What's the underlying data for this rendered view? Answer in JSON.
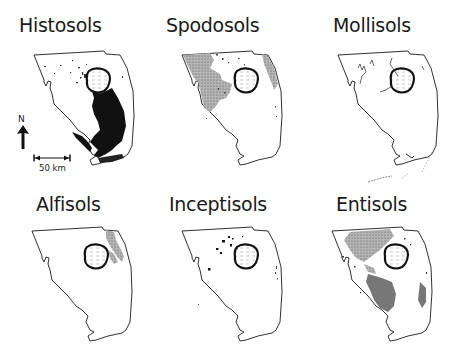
{
  "figure": {
    "panels": [
      {
        "id": "histosols",
        "title": "Histosols",
        "fill": "#111111",
        "pattern": "solid-black",
        "region": "Everglades south of Lake Okeechobee"
      },
      {
        "id": "spodosols",
        "title": "Spodosols",
        "fill": "#9a9a9a",
        "pattern": "stippled-gray",
        "region": "Northwest and east coast"
      },
      {
        "id": "mollisols",
        "title": "Mollisols",
        "fill": "#222222",
        "pattern": "thin-lines",
        "region": "Scattered river traces"
      },
      {
        "id": "alfisols",
        "title": "Alfisols",
        "fill": "#9a9a9a",
        "pattern": "stippled-gray",
        "region": "East coast north of lake"
      },
      {
        "id": "inceptisols",
        "title": "Inceptisols",
        "fill": "#111111",
        "pattern": "small-dots",
        "region": "Scattered near lake"
      },
      {
        "id": "entisols",
        "title": "Entisols",
        "fill": "#8a8a8a",
        "pattern": "stippled-gray",
        "region": "Southwest and broad areas"
      }
    ],
    "legend": {
      "north_label": "N",
      "scale_label": "50 km"
    },
    "annotations": {
      "alfisols_label": "Pine"
    },
    "colors": {
      "outline": "#1a1a1a",
      "background": "#ffffff",
      "lake_outline": "#111111"
    }
  }
}
